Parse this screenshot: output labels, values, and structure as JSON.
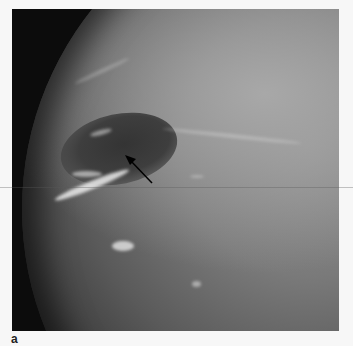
{
  "figure": {
    "panel_label": "a",
    "annotation": "arrow-pointing-to-dark-spot",
    "colors": {
      "background": "#f7f7f7",
      "space": "#0c0c0c",
      "cloud_highlight": "#ebebeb"
    }
  }
}
